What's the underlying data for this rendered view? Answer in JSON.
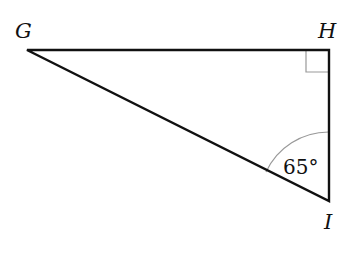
{
  "diagram": {
    "type": "right-triangle",
    "vertices": [
      {
        "name": "G",
        "label": "G"
      },
      {
        "name": "H",
        "label": "H"
      },
      {
        "name": "I",
        "label": "I"
      }
    ],
    "right_angle_at": "H",
    "angle_marks": [
      {
        "vertex": "I",
        "label": "65°"
      }
    ],
    "colors": {
      "stroke": "#111111",
      "arc": "#999999",
      "background": "#ffffff"
    }
  }
}
